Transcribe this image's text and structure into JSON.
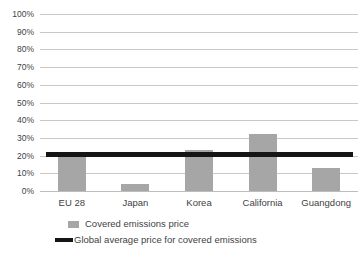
{
  "chart_data": {
    "type": "bar",
    "title": "",
    "subtitle": "",
    "xlabel": "",
    "ylabel": "",
    "categories": [
      "EU 28",
      "Japan",
      "Korea",
      "California",
      "Guangdong"
    ],
    "series": [
      {
        "name": "Covered emissions price",
        "type": "bar",
        "color": "#a6a6a6",
        "values": [
          19,
          4,
          23,
          32,
          13
        ]
      },
      {
        "name": "Global average price for covered emissions",
        "type": "line",
        "color": "#151515",
        "constant_value": 20.5,
        "values": [
          20.5,
          20.5,
          20.5,
          20.5,
          20.5
        ]
      }
    ],
    "ylim": [
      0,
      100
    ],
    "ytick_step": 10,
    "ytick_labels": [
      "0%",
      "10%",
      "20%",
      "30%",
      "40%",
      "50%",
      "60%",
      "70%",
      "80%",
      "90%",
      "100%"
    ],
    "ytick_values": [
      0,
      10,
      20,
      30,
      40,
      50,
      60,
      70,
      80,
      90,
      100
    ],
    "grid": true,
    "grid_axis": "y",
    "grid_color": "#c8c8c8",
    "legend": true,
    "legend_position": "bottom",
    "legend_entries": [
      {
        "label": "Covered emissions price",
        "marker": "bar-swatch",
        "color": "#a6a6a6"
      },
      {
        "label": "Global average price for covered emissions",
        "marker": "line-swatch",
        "color": "#151515"
      }
    ],
    "background_color": "#ffffff",
    "annotations": []
  }
}
